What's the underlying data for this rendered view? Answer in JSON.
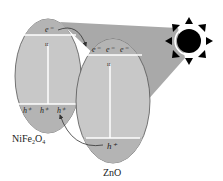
{
  "diagram": {
    "light_source": "sun-icon",
    "materials": [
      {
        "name": "NiFe2O4",
        "label_parts": {
          "base": "NiFe",
          "sub1": "2",
          "mid": "O",
          "sub2": "4"
        },
        "conduction_band": {
          "charges": [
            "e⁻"
          ]
        },
        "valence_band": {
          "charges": [
            "h⁺",
            "h⁺",
            "h⁺"
          ]
        }
      },
      {
        "name": "ZnO",
        "label": "ZnO",
        "conduction_band": {
          "charges": [
            "e⁻",
            "e⁻",
            "e⁻"
          ]
        },
        "valence_band": {
          "charges": [
            "h⁺"
          ]
        }
      }
    ],
    "transfers": [
      {
        "from": "NiFe2O4 conduction band",
        "to": "ZnO conduction band",
        "carrier": "electron"
      },
      {
        "from": "ZnO valence band",
        "to": "NiFe2O4 valence band",
        "carrier": "hole"
      }
    ],
    "colors": {
      "particle_fill": "#c8c8c8",
      "band_fill": "#b4b4b4",
      "light_cone": "#a9a9a9",
      "sun": "#000000",
      "lines": "#ffffff",
      "outline": "#555555"
    }
  }
}
